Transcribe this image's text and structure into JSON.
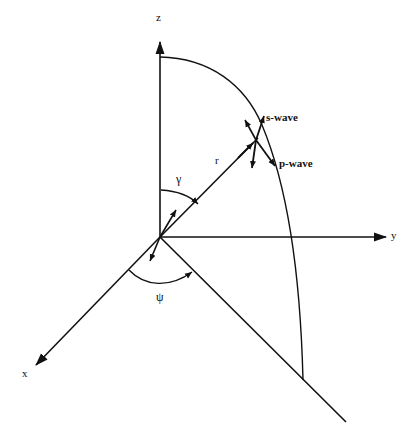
{
  "diagram": {
    "type": "3d-coordinate-geometry",
    "axes": {
      "z": {
        "label": "z"
      },
      "y": {
        "label": "y"
      },
      "x": {
        "label": "x"
      }
    },
    "radius": {
      "label": "r"
    },
    "angles": {
      "polar": {
        "label": "γ"
      },
      "azimuth": {
        "label": "ψ"
      }
    },
    "waves": {
      "s_wave": {
        "label": "s-wave"
      },
      "p_wave": {
        "label": "p-wave"
      }
    },
    "colors": {
      "stroke": "#111111",
      "background": "#ffffff"
    }
  }
}
